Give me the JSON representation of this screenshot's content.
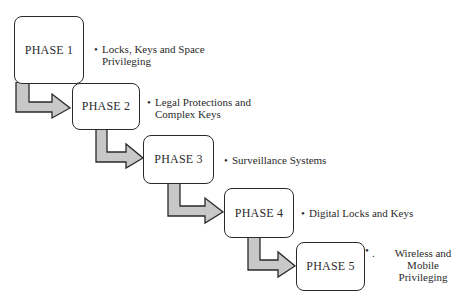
{
  "diagram": {
    "type": "staircase-process",
    "colors": {
      "arrow_fill": "#c8c8c8",
      "stroke": "#2a2a2a",
      "box_fill": "#ffffff"
    },
    "phases": [
      {
        "label": "PHASE 1",
        "bullet": "•",
        "lines": [
          "Locks, Keys and Space",
          "Privileging"
        ]
      },
      {
        "label": "PHASE 2",
        "bullet": "•",
        "lines": [
          "Legal Protections and",
          "Complex Keys"
        ]
      },
      {
        "label": "PHASE 3",
        "bullet": "•",
        "lines": [
          "Surveillance Systems"
        ]
      },
      {
        "label": "PHASE 4",
        "bullet": "•",
        "lines": [
          "Digital Locks and Keys"
        ]
      },
      {
        "label": "PHASE 5",
        "bullet": ".",
        "lines": [
          "Wireless and",
          "Mobile",
          "Privileging"
        ]
      }
    ]
  }
}
